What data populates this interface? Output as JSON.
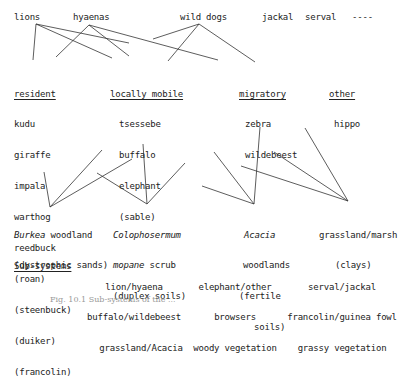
{
  "predators": [
    {
      "id": "lions",
      "label": "lions"
    },
    {
      "id": "hyaenas",
      "label": "hyaenas"
    },
    {
      "id": "wild_dogs",
      "label": "wild dogs"
    },
    {
      "id": "jackal",
      "label": "jackal"
    },
    {
      "id": "serval",
      "label": "serval"
    },
    {
      "id": "dashes",
      "label": "----"
    }
  ],
  "prey_groups": {
    "resident": {
      "heading": "resident",
      "items": [
        "kudu",
        "giraffe",
        "impala",
        "warthog",
        "reedbuck",
        "(roan)",
        "(steenbuck)",
        "(duiker)",
        "(francolin)"
      ]
    },
    "locally_mobile": {
      "heading": "locally mobile",
      "items": [
        "tsessebe",
        "buffalo",
        "elephant",
        "(sable)"
      ]
    },
    "migratory": {
      "heading": "migratory",
      "items": [
        "zebra",
        "wildebeest"
      ]
    },
    "other": {
      "heading": "other",
      "items": [
        "hippo"
      ]
    }
  },
  "habitats": {
    "burkea": {
      "italic": "Burkea",
      "rest": " woodland",
      "line2": "(dystrophic sands)"
    },
    "colophospermum": {
      "line1": "Colophosermum",
      "line2_italic": "mopane",
      "line2_rest": " scrub",
      "line3": "(duplex soils)"
    },
    "acacia": {
      "line1": "Acacia",
      "line2": "woodlands",
      "line3": "(fertile",
      "line4": "soils)"
    },
    "grassland": {
      "line1": "grassland/marsh",
      "line2": "(clays)"
    }
  },
  "subsystems": {
    "heading": "Sub-systems",
    "groups": [
      {
        "lines": [
          "lion/hyaena",
          "buffalo/wildebeest",
          "grassland/Acacia"
        ]
      },
      {
        "lines": [
          "elephant/other",
          "browsers",
          "woody vegetation"
        ]
      },
      {
        "lines": [
          "serval/jackal",
          "francolin/guinea fowl",
          "grassy vegetation"
        ]
      }
    ]
  },
  "caption": "Fig. 10.1 Sub-systems of the ..."
}
